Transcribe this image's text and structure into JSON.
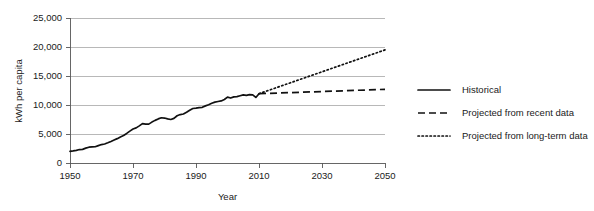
{
  "chart_data": {
    "type": "line",
    "title": "",
    "xlabel": "Year",
    "ylabel": "kWh per capita",
    "xlim": [
      1950,
      2050
    ],
    "ylim": [
      0,
      25000
    ],
    "grid": true,
    "legend_position": "right",
    "x_ticks": [
      "1950",
      "1970",
      "1990",
      "2010",
      "2030",
      "2050"
    ],
    "x_tick_values": [
      1950,
      1970,
      1990,
      2010,
      2030,
      2050
    ],
    "y_ticks": [
      "0",
      "5,000",
      "10,000",
      "15,000",
      "20,000",
      "25,000"
    ],
    "y_tick_values": [
      0,
      5000,
      10000,
      15000,
      20000,
      25000
    ],
    "series": [
      {
        "name": "Historical",
        "style": "solid",
        "x": [
          1950,
          1951,
          1952,
          1953,
          1954,
          1955,
          1956,
          1957,
          1958,
          1959,
          1960,
          1961,
          1962,
          1963,
          1964,
          1965,
          1966,
          1967,
          1968,
          1969,
          1970,
          1971,
          1972,
          1973,
          1974,
          1975,
          1976,
          1977,
          1978,
          1979,
          1980,
          1981,
          1982,
          1983,
          1984,
          1985,
          1986,
          1987,
          1988,
          1989,
          1990,
          1991,
          1992,
          1993,
          1994,
          1995,
          1996,
          1997,
          1998,
          1999,
          2000,
          2001,
          2002,
          2003,
          2004,
          2005,
          2006,
          2007,
          2008,
          2009,
          2010
        ],
        "values": [
          2000,
          2080,
          2180,
          2320,
          2350,
          2560,
          2720,
          2780,
          2800,
          3000,
          3180,
          3280,
          3480,
          3700,
          3950,
          4200,
          4500,
          4750,
          5100,
          5500,
          5850,
          6050,
          6400,
          6800,
          6700,
          6700,
          7050,
          7350,
          7600,
          7800,
          7750,
          7600,
          7500,
          7700,
          8150,
          8350,
          8450,
          8750,
          9100,
          9400,
          9450,
          9550,
          9600,
          9850,
          10050,
          10300,
          10500,
          10600,
          10700,
          10950,
          11350,
          11200,
          11400,
          11450,
          11600,
          11750,
          11650,
          11800,
          11750,
          11300,
          11950
        ]
      },
      {
        "name": "Projected from recent data",
        "style": "dashed",
        "x": [
          2010,
          2050
        ],
        "values": [
          11950,
          12700
        ]
      },
      {
        "name": "Projected from long-term data",
        "style": "dotted",
        "x": [
          2010,
          2050
        ],
        "values": [
          11950,
          19500
        ]
      }
    ],
    "legend": [
      {
        "label": "Historical",
        "style": "solid"
      },
      {
        "label": "Projected from recent data",
        "style": "dashed"
      },
      {
        "label": "Projected from long-term data",
        "style": "dotted"
      }
    ]
  }
}
